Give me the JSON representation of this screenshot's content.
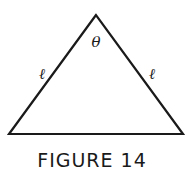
{
  "figure": {
    "caption": "FIGURE 14",
    "shape": "isosceles-triangle",
    "apex_angle_label": "θ",
    "left_side_label": "ℓ",
    "right_side_label": "ℓ",
    "stroke_color": "#1a1a1a"
  }
}
